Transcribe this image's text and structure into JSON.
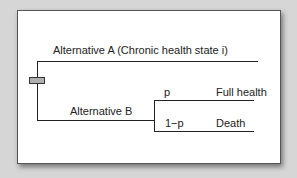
{
  "diagram": {
    "type": "decision-tree",
    "decision_node": {
      "shape": "rectangle",
      "fill": "#b0b0b0"
    },
    "alternatives": [
      {
        "label": "Alternative A (Chronic health state i)"
      },
      {
        "label": "Alternative B",
        "chance_branches": [
          {
            "probability": "p",
            "outcome": "Full health"
          },
          {
            "probability": "1−p",
            "outcome": "Death"
          }
        ]
      }
    ]
  },
  "colors": {
    "background": "#d6d6d6",
    "card": "#ffffff",
    "line": "#222222",
    "node_fill": "#b0b0b0"
  }
}
